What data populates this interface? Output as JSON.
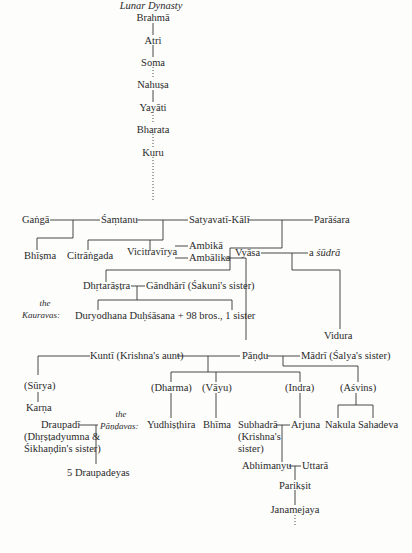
{
  "title": "Lunar Dynasty",
  "lineage": [
    "Brahmā",
    "Atri",
    "Soma",
    "Nahuṣa",
    "Yayāti",
    "Bharata",
    "Kuru"
  ],
  "people": {
    "ganga": "Gaṅgā",
    "santanu": "Śaṃtanu",
    "satyavati": "Satyavatī-Kālī",
    "parasara": "Parāśara",
    "bhisma": "Bhīṣma",
    "citrangada": "Citrāṅgada",
    "vicitravirya": "Vicitravīrya",
    "ambika": "Ambikā",
    "ambalika": "Ambālika",
    "vyasa": "Vyāsa",
    "sudra_prefix": "a ",
    "sudra": "śūdrā",
    "dhrtarastra": "Dhṛtarāṣṭra",
    "gandhari": "Gāndhārī (Śakuni's sister)",
    "kauravas_children": "Duryodhana Duḥśāsana + 98 bros., 1 sister",
    "vidura": "Vidura",
    "kunti": "Kuntī (Krishna's aunt)",
    "pandu": "Pāṇḍu",
    "madri": "Mādrī (Śalya's sister)",
    "surya": "(Sūrya)",
    "karna": "Karṇa",
    "dharma": "(Dharma)",
    "vayu": "(Vāyu)",
    "indra": "(Indra)",
    "asvins": "(Aśvins)",
    "yudhisthira": "Yudhiṣṭhira",
    "bhima": "Bhīma",
    "arjuna": "Arjuna",
    "nakula_sahadeva": "Nakula Sahadeva",
    "subhadra": "Subhadrā",
    "subhadra_note_1": "(Krishna's",
    "subhadra_note_2": "sister)",
    "draupadi": "Draupadī",
    "draupadi_note_1": "(Dhṛṣṭadyumna &",
    "draupadi_note_2": "Śikhaṇḍin's sister)",
    "draupadeyas": "5 Draupadeyas",
    "abhimanyu": "Abhimanyu",
    "uttara": "Uttarā",
    "pariksit": "Parikṣit",
    "janamejaya": "Janamejaya"
  },
  "labels": {
    "kauravas_the": "the",
    "kauravas": "Kauravas:",
    "pandavas_the": "the",
    "pandavas": "Pāṇḍavas:"
  }
}
